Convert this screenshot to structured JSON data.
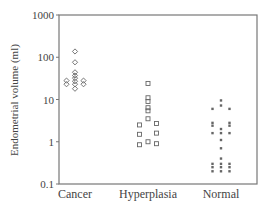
{
  "chart_data": {
    "type": "scatter",
    "subtype": "dot-strip (log scale)",
    "title": "",
    "xlabel": "",
    "ylabel": "Endometrial volume (ml)",
    "yscale": "log",
    "ylim": [
      0.1,
      1000
    ],
    "yticks": [
      1000,
      100,
      10,
      1,
      0.1
    ],
    "ytick_labels": [
      "1000",
      "100",
      "10",
      "1",
      "0.1"
    ],
    "categories": [
      "Cancer",
      "Hyperplasia",
      "Normal"
    ],
    "grid": false,
    "legend": null,
    "series": [
      {
        "name": "Cancer",
        "marker": "diamond-open",
        "points": [
          {
            "offset": 0,
            "value": 137
          },
          {
            "offset": 0,
            "value": 76
          },
          {
            "offset": 0,
            "value": 44
          },
          {
            "offset": 0,
            "value": 37
          },
          {
            "offset": 0,
            "value": 32
          },
          {
            "offset": 0,
            "value": 27
          },
          {
            "offset": 0,
            "value": 23
          },
          {
            "offset": 0,
            "value": 18
          },
          {
            "offset": -1,
            "value": 28
          },
          {
            "offset": -1,
            "value": 23
          },
          {
            "offset": 1,
            "value": 28
          },
          {
            "offset": 1,
            "value": 23
          }
        ]
      },
      {
        "name": "Hyperplasia",
        "marker": "square-open",
        "points": [
          {
            "offset": 0,
            "value": 24
          },
          {
            "offset": 0,
            "value": 11
          },
          {
            "offset": 0,
            "value": 9
          },
          {
            "offset": 0,
            "value": 6.4
          },
          {
            "offset": 0,
            "value": 5.4
          },
          {
            "offset": 0,
            "value": 3.5
          },
          {
            "offset": 0,
            "value": 1.0
          },
          {
            "offset": -1,
            "value": 2.5
          },
          {
            "offset": -1,
            "value": 1.5
          },
          {
            "offset": -1,
            "value": 0.85
          },
          {
            "offset": 1,
            "value": 2.7
          },
          {
            "offset": 1,
            "value": 1.6
          },
          {
            "offset": 1,
            "value": 0.9
          }
        ]
      },
      {
        "name": "Normal",
        "marker": "square-filled-small",
        "points": [
          {
            "offset": 0,
            "value": 9.5
          },
          {
            "offset": 0,
            "value": 7.2
          },
          {
            "offset": -1,
            "value": 6.0
          },
          {
            "offset": 1,
            "value": 6.0
          },
          {
            "offset": -1,
            "value": 2.8
          },
          {
            "offset": -1,
            "value": 2.4
          },
          {
            "offset": 1,
            "value": 2.8
          },
          {
            "offset": 1,
            "value": 2.4
          },
          {
            "offset": 0,
            "value": 2.0
          },
          {
            "offset": 0,
            "value": 1.6
          },
          {
            "offset": -1,
            "value": 1.6
          },
          {
            "offset": 1,
            "value": 1.6
          },
          {
            "offset": 0,
            "value": 1.1
          },
          {
            "offset": 0,
            "value": 0.7
          },
          {
            "offset": 0,
            "value": 0.4
          },
          {
            "offset": -1,
            "value": 0.3
          },
          {
            "offset": 0,
            "value": 0.3
          },
          {
            "offset": 1,
            "value": 0.3
          },
          {
            "offset": -1,
            "value": 0.25
          },
          {
            "offset": 0,
            "value": 0.25
          },
          {
            "offset": 1,
            "value": 0.25
          },
          {
            "offset": -1,
            "value": 0.2
          },
          {
            "offset": 0,
            "value": 0.2
          },
          {
            "offset": 1,
            "value": 0.2
          }
        ]
      }
    ]
  },
  "style": {
    "axis_color": "#777777",
    "marker_color": "#666666"
  }
}
